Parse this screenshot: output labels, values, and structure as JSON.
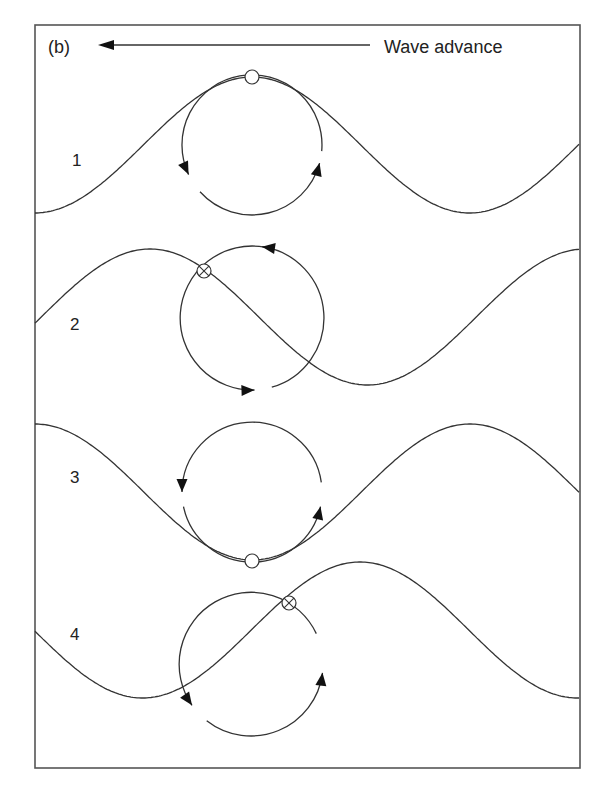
{
  "figure": {
    "panel_label": "(b)",
    "direction_label": "Wave advance",
    "direction": "left",
    "colors": {
      "line": "#333333",
      "frame": "#555555",
      "background": "#ffffff"
    },
    "frame": {
      "x": 35,
      "y": 25,
      "width": 545,
      "height": 743
    },
    "header_arrow": {
      "x1": 370,
      "y1": 45,
      "x2": 98,
      "y2": 45
    },
    "wave_params": {
      "wavelength": 435,
      "amplitude": 68,
      "x_start": 35,
      "x_end": 580
    },
    "panels": [
      {
        "label": "1",
        "label_pos": [
          72,
          166
        ],
        "wave_mid_y": 145,
        "crest_x": 252,
        "orbit": {
          "cx": 252,
          "cy": 145,
          "r": 70
        },
        "particle": {
          "x": 252,
          "y": 77,
          "crossed": false
        },
        "arcs": [
          {
            "start_deg": -5,
            "end_deg": 205,
            "arrow_at_end": true
          },
          {
            "start_deg": 222,
            "end_deg": 345,
            "arrow_at_end": true
          }
        ]
      },
      {
        "label": "2",
        "label_pos": [
          70,
          330
        ],
        "wave_mid_y": 317,
        "crest_x": 150,
        "orbit": {
          "cx": 252,
          "cy": 318,
          "r": 72
        },
        "particle": {
          "x": 204,
          "y": 271,
          "crossed": true
        },
        "arcs": [
          {
            "start_deg": 80,
            "end_deg": 272,
            "arrow_at_end": true
          },
          {
            "start_deg": 286,
            "end_deg": 442,
            "arrow_at_end": true
          }
        ]
      },
      {
        "label": "3",
        "label_pos": [
          70,
          483
        ],
        "wave_mid_y": 492,
        "crest_x": 35,
        "orbit": {
          "cx": 252,
          "cy": 492,
          "r": 70
        },
        "particle": {
          "x": 252,
          "y": 561,
          "crossed": false
        },
        "arcs": [
          {
            "start_deg": 8,
            "end_deg": 180,
            "arrow_at_end": true
          },
          {
            "start_deg": 192,
            "end_deg": 348,
            "arrow_at_end": true
          }
        ]
      },
      {
        "label": "4",
        "label_pos": [
          70,
          640
        ],
        "wave_mid_y": 630,
        "crest_x": 360,
        "orbit": {
          "cx": 251,
          "cy": 664,
          "r": 72
        },
        "particle": {
          "x": 289,
          "y": 603,
          "crossed": true
        },
        "arcs": [
          {
            "start_deg": 25,
            "end_deg": 215,
            "arrow_at_end": true
          },
          {
            "start_deg": 232,
            "end_deg": 353,
            "arrow_at_end": true
          }
        ]
      }
    ]
  }
}
